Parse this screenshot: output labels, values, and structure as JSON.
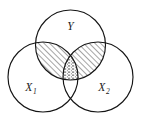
{
  "figure": {
    "kind": "venn-diagram",
    "background_color": "#ffffff",
    "stroke_color": "#151515",
    "hatch_color": "#2b2b2b",
    "stipple_color": "#555555"
  },
  "sets": [
    {
      "id": "Y",
      "label": "Y",
      "subscript": "",
      "cx": 70.5,
      "cy": 45,
      "r": 35,
      "label_x": 70.5,
      "label_y": 30
    },
    {
      "id": "X1",
      "label": "X",
      "subscript": "1",
      "cx": 43,
      "cy": 77,
      "r": 35,
      "label_x": 31,
      "label_y": 91
    },
    {
      "id": "X2",
      "label": "X",
      "subscript": "2",
      "cx": 98,
      "cy": 77,
      "r": 35,
      "label_x": 104,
      "label_y": 91
    }
  ],
  "shaded_regions": [
    {
      "id": "Y-and-X1",
      "name": "y-intersect-x1-region",
      "fill": "diagonal-hatch",
      "hatch_angle": 45
    },
    {
      "id": "Y-and-X2",
      "name": "y-intersect-x2-region",
      "fill": "diagonal-hatch",
      "hatch_angle": 45
    },
    {
      "id": "Y-and-X1-and-X2",
      "name": "triple-intersect-region",
      "fill": "dotted-stipple"
    }
  ]
}
